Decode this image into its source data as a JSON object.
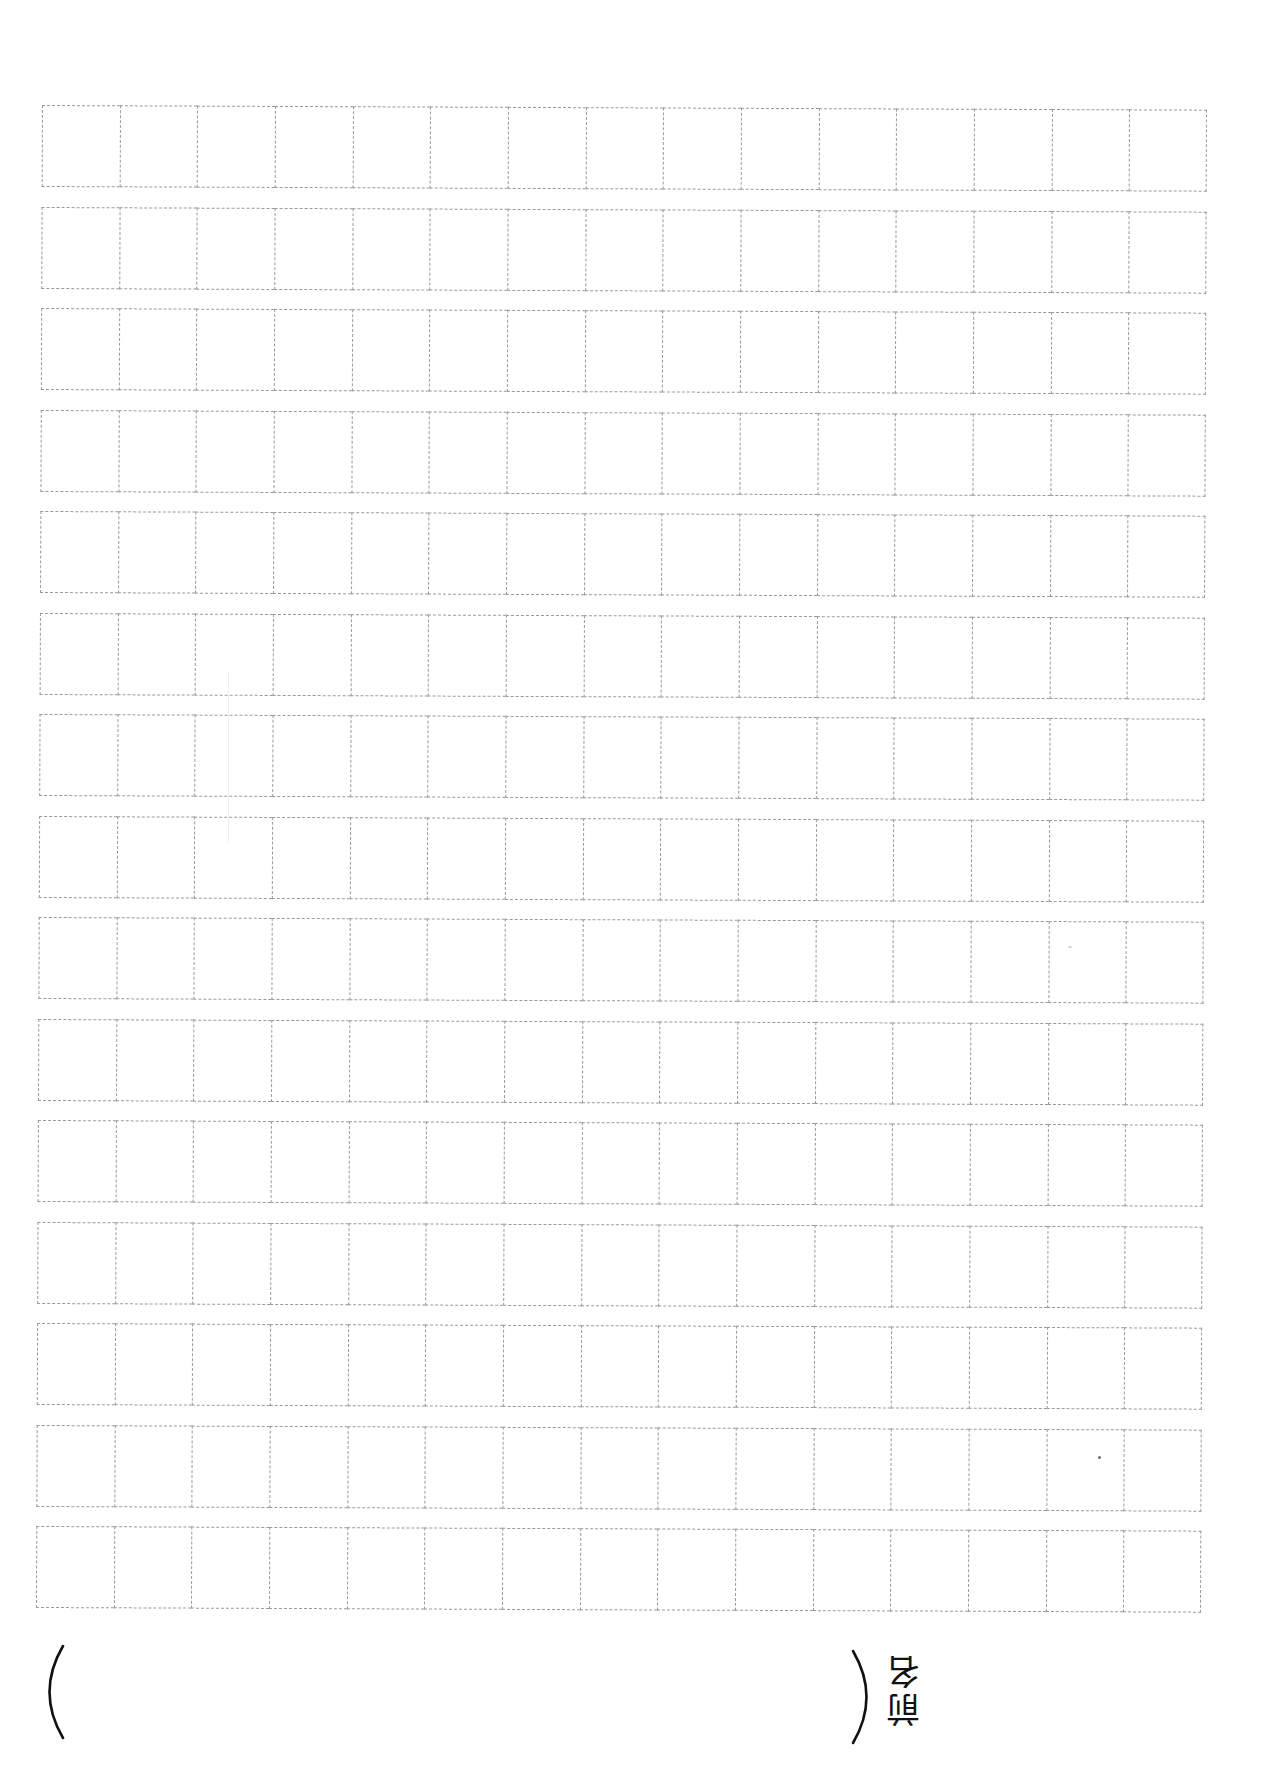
{
  "document": {
    "type": "genkou-youshi-writing-sheet",
    "grid": {
      "rows": 15,
      "columns": 15,
      "line_style": "dashed",
      "line_color": "#9a9a9a"
    },
    "name_field": {
      "label": "名前",
      "label_chars": [
        "名",
        "前"
      ],
      "open_paren": "(",
      "close_paren": ")",
      "value": ""
    }
  }
}
